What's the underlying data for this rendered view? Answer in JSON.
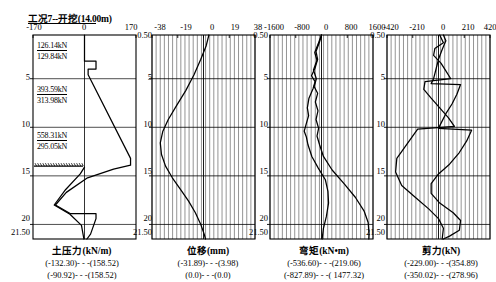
{
  "header": {
    "title": "工况7--开挖(14.00m)"
  },
  "depth_axis": {
    "top_label": "0.50",
    "bottom_label": "21.50",
    "ticks": [
      "5",
      "10",
      "15",
      "20"
    ],
    "tick_values": [
      5,
      10,
      15,
      20
    ],
    "min": 0.5,
    "max": 21.5
  },
  "panels": [
    {
      "id": "earth-pressure",
      "caption": "土压力(kN/m)",
      "xticks": [
        "-170",
        "0",
        "170"
      ],
      "xtick_values": [
        -170,
        0,
        170
      ],
      "xlim": [
        -170,
        170
      ],
      "gridlines": false,
      "range_lines": [
        "(-132.30)- - -(158.52)",
        "(-90.92)- - -(158.52)"
      ],
      "force_labels": [
        {
          "text": "126.14kN",
          "depth": 1.85,
          "underlined": true
        },
        {
          "text": "129.84kN",
          "depth": 3.1,
          "underlined": false
        },
        {
          "text": "393.59kN",
          "depth": 6.3,
          "underlined": true
        },
        {
          "text": "313.98kN",
          "depth": 7.6,
          "underlined": false
        },
        {
          "text": "558.31kN",
          "depth": 10.35,
          "underlined": true
        },
        {
          "text": "295.05kN",
          "depth": 11.65,
          "underlined": false
        }
      ],
      "excavation_depth": 14.0
    },
    {
      "id": "displacement",
      "caption": "位移(mm)",
      "xticks": [
        "-38",
        "-19",
        "0",
        "19",
        "38"
      ],
      "xtick_values": [
        -38,
        -19,
        0,
        19,
        38
      ],
      "xlim": [
        -38,
        38
      ],
      "gridlines": true,
      "range_lines": [
        "(-31.89)- - -(3.98)",
        "(0.0)- - -(0.0)"
      ]
    },
    {
      "id": "bending-moment",
      "caption": "弯矩(kN•m)",
      "xticks": [
        "-1600",
        "-800",
        "0",
        "800",
        "1600"
      ],
      "xtick_values": [
        -1600,
        -800,
        0,
        800,
        1600
      ],
      "xlim": [
        -1600,
        1600
      ],
      "gridlines": true,
      "range_lines": [
        "(-536.60)- - -(219.06)",
        "(-827.89)- - -( 1477.32)"
      ]
    },
    {
      "id": "shear-force",
      "caption": "剪力(kN)",
      "xticks": [
        "-420",
        "-210",
        "0",
        "210",
        "420"
      ],
      "xtick_values": [
        -420,
        -210,
        0,
        210,
        420
      ],
      "xlim": [
        -420,
        420
      ],
      "gridlines": true,
      "range_lines": [
        "(-229.00)- - -(354.89)",
        "(-350.02)- - -(278.96)"
      ]
    }
  ],
  "chart_data": {
    "type": "line",
    "title": "工况7--开挖(14.00m)",
    "ylabel": "深度 (m)",
    "ylim": [
      0.5,
      21.5
    ],
    "yticks": [
      5,
      10,
      15,
      20
    ],
    "subplots": [
      {
        "name": "earth-pressure",
        "xlabel": "土压力(kN/m)",
        "xlim": [
          -170,
          170
        ],
        "xticks": [
          -170,
          0,
          170
        ],
        "series": [
          {
            "name": "active-pressure",
            "points": [
              [
                0.0,
                0.5
              ],
              [
                0.0,
                3.2
              ],
              [
                38.0,
                3.2
              ],
              [
                38.0,
                4.0
              ],
              [
                12.0,
                4.0
              ],
              [
                12.0,
                4.6
              ],
              [
                152.0,
                13.2
              ],
              [
                152.0,
                13.9
              ],
              [
                96.0,
                14.3
              ],
              [
                10.0,
                15.2
              ],
              [
                -60.0,
                16.7
              ],
              [
                -96.0,
                18.0
              ],
              [
                -46.0,
                18.9
              ],
              [
                38.0,
                18.9
              ],
              [
                38.0,
                19.4
              ],
              [
                20.0,
                21.0
              ],
              [
                8.0,
                21.5
              ]
            ]
          },
          {
            "name": "passive-pressure",
            "points": [
              [
                0.0,
                14.1
              ],
              [
                -14.0,
                14.8
              ],
              [
                -62.0,
                16.4
              ],
              [
                -100.0,
                18.0
              ],
              [
                -48.0,
                18.95
              ],
              [
                -10.0,
                20.1
              ],
              [
                -2.0,
                21.5
              ]
            ]
          }
        ],
        "annotations": [
          {
            "text": "126.14kN",
            "depth": 1.85
          },
          {
            "text": "129.84kN",
            "depth": 3.1
          },
          {
            "text": "393.59kN",
            "depth": 6.3
          },
          {
            "text": "313.98kN",
            "depth": 7.6
          },
          {
            "text": "558.31kN",
            "depth": 10.35
          },
          {
            "text": "295.05kN",
            "depth": 11.65
          }
        ],
        "value_range": [
          "(-132.30)- - -(158.52)",
          "(-90.92)- - -(158.52)"
        ]
      },
      {
        "name": "displacement",
        "xlabel": "位移(mm)",
        "xlim": [
          -38,
          38
        ],
        "xticks": [
          -38,
          -19,
          0,
          19,
          38
        ],
        "series": [
          {
            "name": "lateral-displacement",
            "points": [
              [
                3.98,
                0.5
              ],
              [
                2.0,
                1.6
              ],
              [
                -2.0,
                3.0
              ],
              [
                -7.0,
                4.6
              ],
              [
                -13.0,
                6.2
              ],
              [
                -20.0,
                7.8
              ],
              [
                -26.0,
                9.2
              ],
              [
                -30.0,
                10.4
              ],
              [
                -31.89,
                11.6
              ],
              [
                -31.0,
                12.8
              ],
              [
                -28.0,
                14.0
              ],
              [
                -23.0,
                15.2
              ],
              [
                -17.0,
                16.4
              ],
              [
                -11.0,
                17.6
              ],
              [
                -6.0,
                18.8
              ],
              [
                -2.0,
                20.0
              ],
              [
                0.5,
                21.0
              ],
              [
                1.5,
                21.5
              ]
            ]
          }
        ],
        "value_range": [
          "(-31.89)- - -(3.98)",
          "(0.0)- - -(0.0)"
        ]
      },
      {
        "name": "bending-moment",
        "xlabel": "弯矩(kN•m)",
        "xlim": [
          -1600,
          1600
        ],
        "xticks": [
          -1600,
          -800,
          0,
          800,
          1600
        ],
        "series": [
          {
            "name": "moment-case-1",
            "points": [
              [
                0,
                0.5
              ],
              [
                -60,
                1.2
              ],
              [
                -170,
                2.2
              ],
              [
                -120,
                3.0
              ],
              [
                -200,
                3.9
              ],
              [
                -310,
                4.7
              ],
              [
                -200,
                5.3
              ],
              [
                -260,
                6.0
              ],
              [
                -390,
                7.0
              ],
              [
                -440,
                8.0
              ],
              [
                -400,
                8.8
              ],
              [
                -470,
                9.6
              ],
              [
                -536.6,
                10.4
              ],
              [
                -470,
                11.0
              ],
              [
                -420,
                11.8
              ],
              [
                -300,
                13.0
              ],
              [
                -100,
                14.2
              ],
              [
                120,
                15.4
              ],
              [
                200,
                16.6
              ],
              [
                219.06,
                17.8
              ],
              [
                150,
                19.2
              ],
              [
                60,
                20.4
              ],
              [
                20,
                21.5
              ]
            ]
          },
          {
            "name": "moment-case-2",
            "points": [
              [
                0,
                0.5
              ],
              [
                -90,
                1.3
              ],
              [
                -210,
                2.3
              ],
              [
                -140,
                3.1
              ],
              [
                -250,
                4.1
              ],
              [
                -160,
                5.0
              ],
              [
                -230,
                5.8
              ],
              [
                -120,
                6.5
              ],
              [
                -190,
                7.4
              ],
              [
                -110,
                8.3
              ],
              [
                -170,
                9.2
              ],
              [
                -90,
                10.1
              ],
              [
                -140,
                10.9
              ],
              [
                -60,
                11.8
              ],
              [
                60,
                13.0
              ],
              [
                330,
                14.4
              ],
              [
                700,
                15.8
              ],
              [
                1050,
                17.2
              ],
              [
                1320,
                18.6
              ],
              [
                1450,
                19.8
              ],
              [
                1477.32,
                21.0
              ],
              [
                1470,
                21.5
              ]
            ]
          }
        ],
        "value_range": [
          "(-536.60)- - -(219.06)",
          "(-827.89)- - -( 1477.32)"
        ]
      },
      {
        "name": "shear-force",
        "xlabel": "剪力(kN)",
        "xlim": [
          -420,
          420
        ],
        "xticks": [
          -420,
          -210,
          0,
          210,
          420
        ],
        "series": [
          {
            "name": "shear-case-1",
            "points": [
              [
                10,
                0.5
              ],
              [
                40,
                1.3
              ],
              [
                -30,
                1.9
              ],
              [
                -40,
                2.6
              ],
              [
                20,
                3.4
              ],
              [
                60,
                4.2
              ],
              [
                100,
                5.0
              ],
              [
                -110,
                5.3
              ],
              [
                -120,
                6.1
              ],
              [
                -60,
                7.0
              ],
              [
                10,
                8.0
              ],
              [
                80,
                9.0
              ],
              [
                130,
                9.9
              ],
              [
                -170,
                10.2
              ],
              [
                -250,
                11.6
              ],
              [
                -340,
                13.2
              ],
              [
                -350.02,
                14.6
              ],
              [
                -300,
                16.0
              ],
              [
                -190,
                17.2
              ],
              [
                -80,
                18.4
              ],
              [
                0,
                19.4
              ],
              [
                40,
                20.4
              ],
              [
                30,
                21.5
              ]
            ]
          },
          {
            "name": "shear-case-2",
            "points": [
              [
                40,
                0.5
              ],
              [
                60,
                1.1
              ],
              [
                30,
                2.0
              ],
              [
                0,
                3.0
              ],
              [
                -20,
                4.0
              ],
              [
                -40,
                5.0
              ],
              [
                -60,
                5.5
              ],
              [
                180,
                5.6
              ],
              [
                150,
                6.6
              ],
              [
                110,
                7.6
              ],
              [
                60,
                8.6
              ],
              [
                20,
                9.6
              ],
              [
                0,
                10.1
              ],
              [
                270,
                10.3
              ],
              [
                230,
                11.4
              ],
              [
                170,
                12.6
              ],
              [
                90,
                13.8
              ],
              [
                0,
                14.8
              ],
              [
                -60,
                15.8
              ],
              [
                -60,
                16.8
              ],
              [
                10,
                17.8
              ],
              [
                120,
                18.8
              ],
              [
                180,
                19.6
              ],
              [
                170,
                20.6
              ],
              [
                90,
                21.2
              ],
              [
                40,
                21.5
              ]
            ]
          }
        ],
        "value_range": [
          "(-229.00)- - -(354.89)",
          "(-350.02)- - -(278.96)"
        ]
      }
    ]
  }
}
